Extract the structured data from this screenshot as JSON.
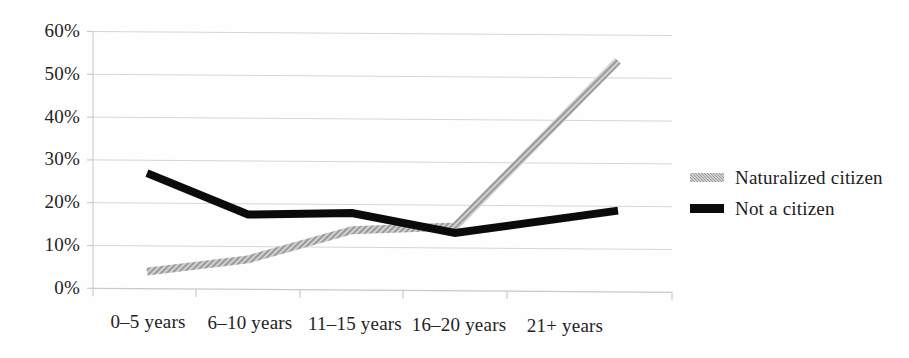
{
  "chart_data": {
    "type": "line",
    "title": "",
    "subtitle": "",
    "xlabel": "",
    "ylabel": "",
    "categories": [
      "0–5 years",
      "6–10 years",
      "11–15 years",
      "16–20 years",
      "21+ years"
    ],
    "series": [
      {
        "name": "Naturalized citizen",
        "color": "#9a9a9a",
        "style": "dotted-thick",
        "values": [
          4,
          7,
          14,
          15,
          54
        ]
      },
      {
        "name": "Not a citizen",
        "color": "#0b0b0b",
        "style": "solid-thick",
        "values": [
          27,
          17.5,
          18,
          13.5,
          19
        ]
      }
    ],
    "ylim": [
      0,
      60
    ],
    "yticks": [
      0,
      10,
      20,
      30,
      40,
      50,
      60
    ],
    "ytick_labels": [
      "0%",
      "10%",
      "20%",
      "30%",
      "40%",
      "50%",
      "60%"
    ],
    "grid": true,
    "grid_color": "#d8d8d8",
    "legend_position": "right"
  },
  "legend": {
    "items": [
      {
        "label": "Naturalized citizen",
        "marker": "gray-dotted-line-marker"
      },
      {
        "label": "Not a citizen",
        "marker": "black-solid-line-marker"
      }
    ]
  },
  "axes": {
    "y_labels": [
      "60%",
      "50%",
      "40%",
      "30%",
      "20%",
      "10%",
      "0%"
    ],
    "x_labels": [
      "0–5 years",
      "6–10 years",
      "11–15 years",
      "16–20 years",
      "21+ years"
    ]
  }
}
